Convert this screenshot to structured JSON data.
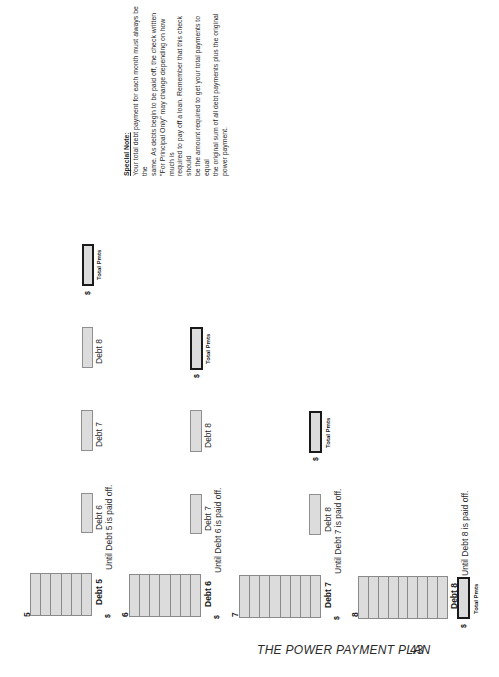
{
  "special_note": {
    "title": "Special Note:",
    "lines": [
      "Your total debt payment for each month must always be the",
      "same. As debts begin to be paid off, the check written",
      "\"For Principal Only\" may change depending on how much is",
      "required to pay off a loan. Remember that this check should",
      "be the amount required to get your total payments to equal",
      "the original sum of all debt payments plus the original",
      "power payment."
    ]
  },
  "rows": [
    {
      "number": "5",
      "debt_label": "Debt 5",
      "dollar": "$",
      "segments": 6,
      "until_text": "Until Debt 5 is paid off.",
      "boxes": [
        "Debt 6",
        "Debt 7",
        "Debt 8"
      ],
      "total_label": "Total Pmts",
      "total_dollar": "$"
    },
    {
      "number": "6",
      "debt_label": "Debt 6",
      "dollar": "$",
      "segments": 7,
      "until_text": "Until Debt 6 is paid off.",
      "boxes": [
        "Debt 7",
        "Debt 8"
      ],
      "total_label": "Total Pmts",
      "total_dollar": "$"
    },
    {
      "number": "7",
      "debt_label": "Debt 7",
      "dollar": "$",
      "segments": 8,
      "until_text": "Until Debt 7 is paid off.",
      "boxes": [
        "Debt 8"
      ],
      "total_label": "Total Pmts",
      "total_dollar": "$"
    },
    {
      "number": "8",
      "debt_label": "Debt 8",
      "dollar": "$",
      "segments": 9,
      "until_text": "Until Debt 8 is paid off.",
      "boxes": [],
      "total_label": "Total Pmts",
      "total_dollar": "$"
    }
  ],
  "footer": {
    "title": "THE POWER PAYMENT PLAN",
    "page_number": "43"
  }
}
